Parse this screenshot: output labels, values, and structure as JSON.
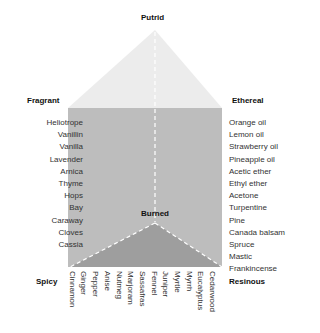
{
  "diagram": {
    "colors": {
      "top_face": "#ececec",
      "front_face": "#bdbdbd",
      "bottom_face": "#9e9e9e",
      "dashed_edge": "#ffffff"
    },
    "corners": {
      "top": "Putrid",
      "upper_left": "Fragrant",
      "upper_right": "Ethereal",
      "center": "Burned",
      "lower_left": "Spicy",
      "lower_right": "Resinous"
    },
    "left_items": [
      "Heliotrope",
      "Vanillin",
      "Vanilla",
      "Lavender",
      "Arnica",
      "Thyme",
      "Hops",
      "Bay",
      "Caraway",
      "Cloves",
      "Cassia"
    ],
    "right_items": [
      "Orange oil",
      "Lemon oil",
      "Strawberry oil",
      "Pineapple oil",
      "Acetic ether",
      "Ethyl ether",
      "Acetone",
      "Turpentine",
      "Pine",
      "Canada balsam",
      "Spruce",
      "Mastic",
      "Frankincense"
    ],
    "bottom_items": [
      "Cinnamon",
      "Ginger",
      "Pepper",
      "Anise",
      "Nutmeg",
      "Marjoram",
      "Sassafras",
      "Fennel",
      "Juniper",
      "Myrtle",
      "Myrrh",
      "Eucalyptus",
      "Cedarwood"
    ]
  }
}
